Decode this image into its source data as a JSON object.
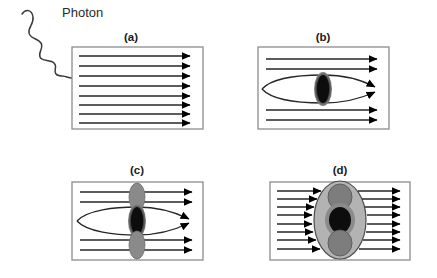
{
  "figure": {
    "title_text": "Photon",
    "panels": [
      {
        "id": "a",
        "label": "(a)",
        "box": {
          "x": 72,
          "y": 47,
          "width": 131,
          "height": 82
        },
        "straight_arrow_count": 8,
        "ellipses": [],
        "curved_lines": 0,
        "has_photon": true
      },
      {
        "id": "b",
        "label": "(b)",
        "box": {
          "x": 258,
          "y": 47,
          "width": 131,
          "height": 82
        },
        "straight_arrow_count": 4,
        "ellipses": [
          {
            "kind": "black-core",
            "cx_frac": 0.5,
            "cy_frac": 0.5,
            "rx": 9,
            "ry": 17
          }
        ],
        "curved_lines": 2,
        "has_photon": false
      },
      {
        "id": "c",
        "label": "(c)",
        "box": {
          "x": 72,
          "y": 182,
          "width": 131,
          "height": 78
        },
        "straight_arrow_count": 4,
        "ellipses": [
          {
            "kind": "gray",
            "cx_frac": 0.5,
            "cy_frac": 0.18,
            "rx": 8,
            "ry": 14
          },
          {
            "kind": "black-core",
            "cx_frac": 0.5,
            "cy_frac": 0.5,
            "rx": 9,
            "ry": 17
          },
          {
            "kind": "gray",
            "cx_frac": 0.5,
            "cy_frac": 0.82,
            "rx": 8,
            "ry": 14
          }
        ],
        "curved_lines": 2,
        "has_photon": false
      },
      {
        "id": "d",
        "label": "(d)",
        "box": {
          "x": 270,
          "y": 182,
          "width": 140,
          "height": 78
        },
        "straight_arrow_count": 8,
        "ellipses": [
          {
            "kind": "big-shell",
            "cx_frac": 0.5,
            "cy_frac": 0.5,
            "rx": 26,
            "ry": 39
          },
          {
            "kind": "gray",
            "cx_frac": 0.5,
            "cy_frac": 0.2,
            "rx": 12,
            "ry": 13
          },
          {
            "kind": "black-core",
            "cx_frac": 0.5,
            "cy_frac": 0.5,
            "rx": 13,
            "ry": 15
          },
          {
            "kind": "gray",
            "cx_frac": 0.5,
            "cy_frac": 0.8,
            "rx": 12,
            "ry": 13
          }
        ],
        "curved_lines": 0,
        "has_photon": false,
        "blocked": true
      }
    ]
  },
  "colors": {
    "background": "#ffffff",
    "box_border": "#8c8c8c",
    "field_line": "#262626",
    "arrow_head": "#000000",
    "ellipse_black": "#0d0d0d",
    "ellipse_gray": "#8a8a8a",
    "ellipse_shell": "#b3b3b3",
    "photon_wave": "#3a3a3a",
    "label_text": "#1a1a1a"
  },
  "labels": {
    "photon": "Photon",
    "panel_a": "(a)",
    "panel_b": "(b)",
    "panel_c": "(c)",
    "panel_d": "(d)"
  }
}
